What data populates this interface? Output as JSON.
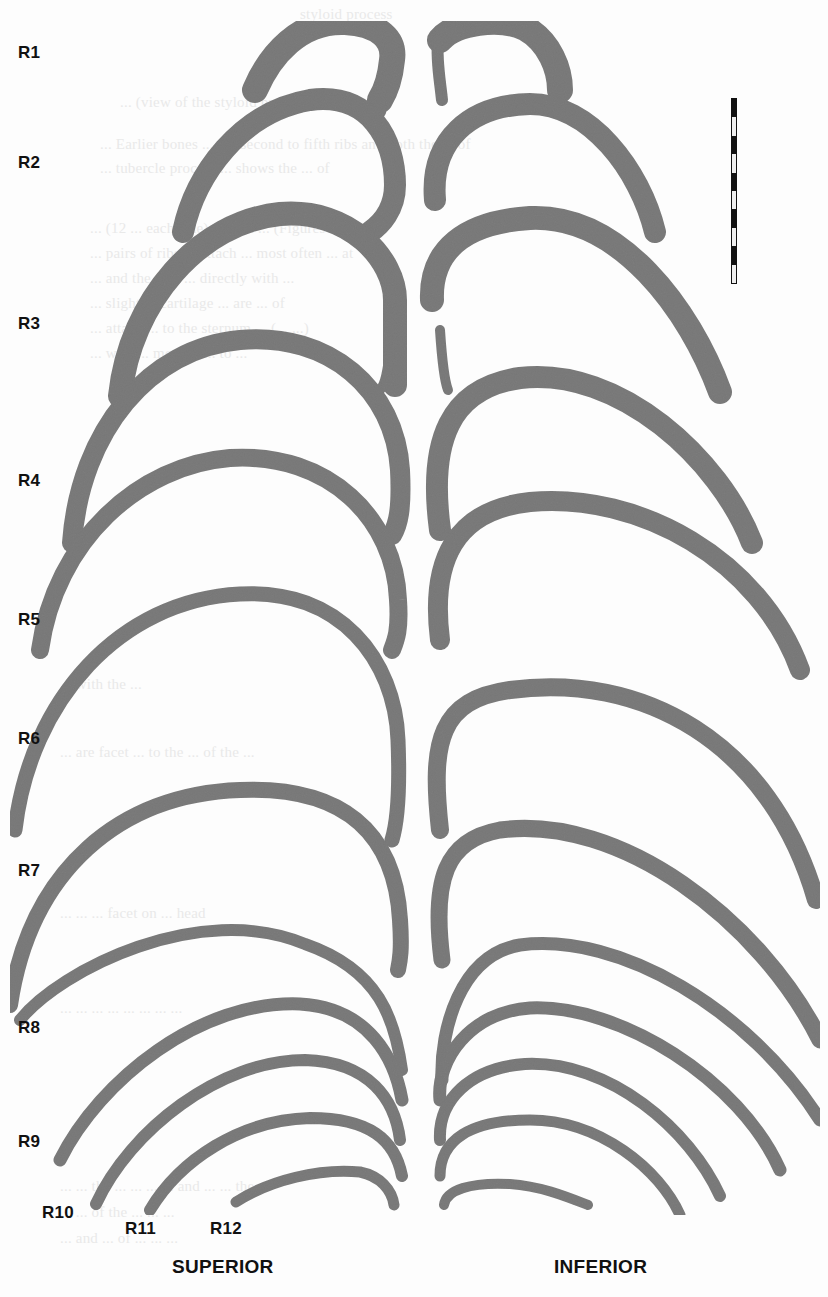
{
  "figure": {
    "colors": {
      "bone": "#7c7c7c",
      "bone_dark": "#5e5e5e",
      "label": "#111111",
      "background": "#fdfdfd"
    },
    "rib_labels": [
      {
        "id": "R1",
        "text": "R1"
      },
      {
        "id": "R2",
        "text": "R2"
      },
      {
        "id": "R3",
        "text": "R3"
      },
      {
        "id": "R4",
        "text": "R4"
      },
      {
        "id": "R5",
        "text": "R5"
      },
      {
        "id": "R6",
        "text": "R6"
      },
      {
        "id": "R7",
        "text": "R7"
      },
      {
        "id": "R8",
        "text": "R8"
      },
      {
        "id": "R9",
        "text": "R9"
      },
      {
        "id": "R10",
        "text": "R10"
      },
      {
        "id": "R11",
        "text": "R11"
      },
      {
        "id": "R12",
        "text": "R12"
      }
    ],
    "views": {
      "left": "SUPERIOR",
      "right": "INFERIOR"
    },
    "scale_bar": {
      "segments": 10
    },
    "bleed_through_text": [
      "styloid          process",
      "... (view of the styloid process) ...",
      "... Earlier bones ... the second to fifth ribs and both the ... of",
      "... tubercle process ... shows the ... of",
      "... (12 ... each side), which ... (Figures ... and ...",
      "... pairs of ribs ... attach ... most often ... at",
      "... and the first ... directly with ...",
      "... slight ... cartilage ... are ... of",
      "... attach ... to the sternum ... (... ...)",
      "... with ... most of ... to ...",
      "... with the ... ",
      "... are facet ... to the ... of the ...",
      "... ... ... facet on ... head",
      "... ... ... ... ... ... ... ...",
      "... ... the ... ... ... ... and ... ... the ...",
      "... ... of the ... ... ...",
      "... and ... of ... ... ..."
    ]
  }
}
